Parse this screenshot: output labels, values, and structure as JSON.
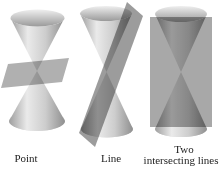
{
  "labels": {
    "point": "Point",
    "line": "Line",
    "two_line1": "Two",
    "two_line2": "intersecting lines"
  },
  "colors": {
    "background": "#ffffff",
    "text": "#1c1c1c",
    "cone_edge_left": "#9e9e9e",
    "cone_highlight": "#eaeaea",
    "cone_mid": "#cdcdcd",
    "cone_edge_right": "#8f8f8f",
    "rim_top": "#efefef",
    "rim_bottom": "#9a9a9a",
    "base_top": "#aeaeae",
    "base_bottom": "#e2e2e2",
    "plane_point": "#b0b0b0",
    "plane_line": "#9c9c9c",
    "plane_two": "#a8a8a8"
  }
}
